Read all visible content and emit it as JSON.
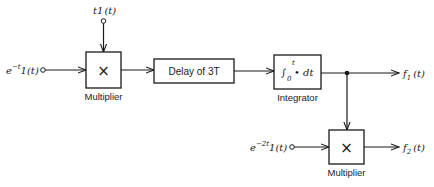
{
  "diagram": {
    "inputs": {
      "top": {
        "label": "t1(t)",
        "base": "t1",
        "arg": "(t)"
      },
      "left": {
        "label": "e^{-t}1(t)",
        "base": "e",
        "sup": "−t",
        "rest": "1(t)"
      },
      "lower": {
        "label": "e^{-2t}1(t)",
        "base": "e",
        "sup": "−2t",
        "rest": "1(t)"
      }
    },
    "blocks": {
      "multiplier1": {
        "symbol": "×",
        "caption": "Multiplier"
      },
      "delay": {
        "label": "Delay of 3T"
      },
      "integrator": {
        "integral": "∫",
        "lower_limit": "0",
        "upper_limit": "t",
        "body": "• dt",
        "caption": "Integrator"
      },
      "multiplier2": {
        "symbol": "×",
        "caption": "Multiplier"
      }
    },
    "outputs": {
      "f1": {
        "label": "f1(t)",
        "base": "f",
        "sub": "1",
        "arg": "(t)"
      },
      "f2": {
        "label": "f2(t)",
        "base": "f",
        "sub": "2",
        "arg": "(t)"
      }
    }
  }
}
